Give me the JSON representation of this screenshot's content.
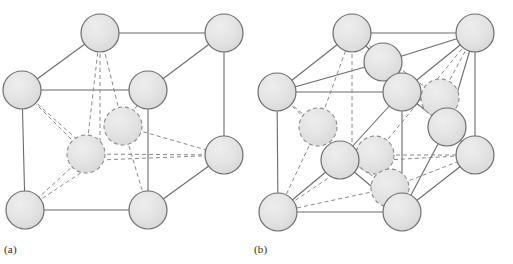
{
  "figure": {
    "background_color": "#ffffff",
    "width": 513,
    "height": 264
  },
  "style": {
    "atom_fill": "#e2e2e2",
    "atom_fill_dashed": "#e2e2e2",
    "atom_stroke": "#6e6e6e",
    "atom_stroke_dashed": "#8a8a8a",
    "bond_solid_color": "#6b6b6b",
    "bond_dashed_color": "#8a8a8a",
    "bond_width": 1.1,
    "atom_stroke_width": 1.2,
    "dash_pattern": "4,3"
  },
  "panels": [
    {
      "id": "a",
      "label": "(a)",
      "description": "Cubic unit cell with corner atoms, one face atom and interior atoms shown with dashed outlines",
      "atom_radius": 19,
      "cube": {
        "front_bottom_left": [
          25,
          210
        ],
        "front_bottom_right": [
          148,
          210
        ],
        "front_top_left": [
          25,
          90
        ],
        "front_top_right": [
          148,
          90
        ],
        "back_bottom_left": [
          100,
          160
        ],
        "back_bottom_right": [
          224,
          155
        ],
        "back_top_left": [
          100,
          33
        ],
        "back_top_right": [
          224,
          33
        ]
      },
      "atoms": [
        {
          "name": "corner-back-top-left",
          "cx": 100,
          "cy": 33,
          "style": "solid"
        },
        {
          "name": "corner-back-top-right",
          "cx": 224,
          "cy": 33,
          "style": "solid"
        },
        {
          "name": "corner-front-top-left",
          "cx": 22,
          "cy": 90,
          "style": "solid"
        },
        {
          "name": "corner-front-top-right",
          "cx": 148,
          "cy": 90,
          "style": "solid"
        },
        {
          "name": "corner-back-bottom-right",
          "cx": 224,
          "cy": 155,
          "style": "solid"
        },
        {
          "name": "corner-front-bottom-left",
          "cx": 25,
          "cy": 210,
          "style": "solid"
        },
        {
          "name": "corner-front-bottom-right",
          "cx": 148,
          "cy": 210,
          "style": "solid"
        },
        {
          "name": "interior-atom-upper",
          "cx": 123,
          "cy": 126,
          "style": "dashed"
        },
        {
          "name": "interior-atom-lower",
          "cx": 86,
          "cy": 154,
          "style": "dashed"
        }
      ]
    },
    {
      "id": "b",
      "label": "(b)",
      "description": "Face-centred cubic unit cell with corner atoms, face-centre atoms and interior atoms with dashed outlines",
      "atom_radius": 19,
      "cube": {
        "front_bottom_left": [
          278,
          212
        ],
        "front_bottom_right": [
          402,
          212
        ],
        "front_top_left": [
          278,
          92
        ],
        "front_top_right": [
          402,
          92
        ],
        "back_bottom_left": [
          352,
          162
        ],
        "back_bottom_right": [
          475,
          155
        ],
        "back_top_left": [
          352,
          33
        ],
        "back_top_right": [
          475,
          33
        ]
      },
      "atoms": [
        {
          "name": "corner-back-top-left",
          "cx": 352,
          "cy": 33,
          "style": "solid"
        },
        {
          "name": "corner-back-top-right",
          "cx": 475,
          "cy": 33,
          "style": "solid"
        },
        {
          "name": "face-atom-top",
          "cx": 383,
          "cy": 62,
          "style": "solid"
        },
        {
          "name": "corner-front-top-left",
          "cx": 277,
          "cy": 92,
          "style": "solid"
        },
        {
          "name": "face-atom-centre-upper",
          "cx": 402,
          "cy": 92,
          "style": "solid"
        },
        {
          "name": "face-atom-right-back",
          "cx": 440,
          "cy": 98,
          "style": "dashed"
        },
        {
          "name": "face-atom-right-front",
          "cx": 447,
          "cy": 127,
          "style": "solid"
        },
        {
          "name": "corner-back-bottom-right",
          "cx": 475,
          "cy": 155,
          "style": "solid"
        },
        {
          "name": "face-atom-left",
          "cx": 318,
          "cy": 127,
          "style": "dashed"
        },
        {
          "name": "interior-atom-left",
          "cx": 340,
          "cy": 160,
          "style": "solid"
        },
        {
          "name": "interior-atom-centre",
          "cx": 375,
          "cy": 155,
          "style": "dashed"
        },
        {
          "name": "face-atom-bottom",
          "cx": 390,
          "cy": 188,
          "style": "dashed"
        },
        {
          "name": "corner-front-bottom-left",
          "cx": 278,
          "cy": 212,
          "style": "solid"
        },
        {
          "name": "corner-front-bottom-right",
          "cx": 402,
          "cy": 212,
          "style": "solid"
        }
      ]
    }
  ]
}
